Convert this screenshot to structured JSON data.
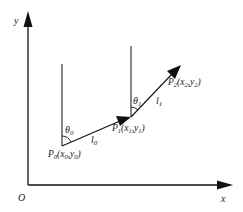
{
  "diagram": {
    "type": "two-link kinematic chain in plane",
    "axes": {
      "x_label": "x",
      "y_label": "y",
      "origin_label": "O"
    },
    "points": [
      {
        "id": "P0",
        "label_base": "P",
        "label_sub": "0",
        "coords_label": "(x",
        "x_sub": "0",
        "sep": ",y",
        "y_sub": "0",
        "close": ")"
      },
      {
        "id": "P1",
        "label_base": "P",
        "label_sub": "1",
        "coords_label": "(x",
        "x_sub": "1",
        "sep": ",y",
        "y_sub": "1",
        "close": ")"
      },
      {
        "id": "P2",
        "label_base": "P",
        "label_sub": "2",
        "coords_label": "(x",
        "x_sub": "2",
        "sep": ",y",
        "y_sub": "2",
        "close": ")"
      }
    ],
    "links": [
      {
        "id": "l0",
        "base": "l",
        "sub": "0",
        "from": "P0",
        "to": "P1"
      },
      {
        "id": "l1",
        "base": "l",
        "sub": "1",
        "from": "P1",
        "to": "P2"
      }
    ],
    "angles": [
      {
        "id": "theta0",
        "base": "θ",
        "sub": "0",
        "at": "P0"
      },
      {
        "id": "theta1",
        "base": "θ",
        "sub": "1",
        "at": "P1"
      }
    ],
    "colors": {
      "line": "#111111",
      "background": "#ffffff"
    }
  }
}
